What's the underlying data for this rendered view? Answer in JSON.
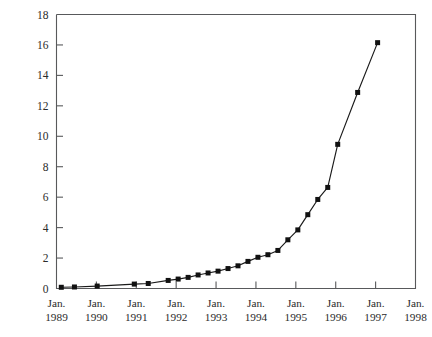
{
  "chart_data": {
    "type": "line",
    "title": "",
    "subtitle": "",
    "xlabel": "",
    "ylabel": "",
    "grid": false,
    "legend": "none",
    "axis_color": "#58595b",
    "series_color": "#111111",
    "marker": "square",
    "ylim": [
      0,
      18
    ],
    "yticks": [
      0,
      2,
      4,
      6,
      8,
      10,
      12,
      14,
      16,
      18
    ],
    "ytick_labels": [
      "0",
      "2",
      "4",
      "6",
      "8",
      "10",
      "12",
      "14",
      "16",
      "18"
    ],
    "xtick_labels": [
      "Jan.\n1989",
      "Jan.\n1990",
      "Jan.\n1991",
      "Jan.\n1992",
      "Jan.\n1993",
      "Jan.\n1994",
      "Jan.\n1995",
      "Jan.\n1996",
      "Jan.\n1997",
      "Jan.\n1998"
    ],
    "xtick_lines": [
      "Jan.",
      "Jan.",
      "Jan.",
      "Jan.",
      "Jan.",
      "Jan.",
      "Jan.",
      "Jan.",
      "Jan.",
      "Jan."
    ],
    "xtick_years": [
      "1989",
      "1990",
      "1991",
      "1992",
      "1993",
      "1994",
      "1995",
      "1996",
      "1997",
      "1998"
    ],
    "xlim_years": [
      1989.0,
      1998.0
    ],
    "x": [
      1989.12,
      1989.45,
      1990.02,
      1990.95,
      1991.3,
      1991.8,
      1992.05,
      1992.3,
      1992.55,
      1992.8,
      1993.05,
      1993.3,
      1993.55,
      1993.8,
      1994.05,
      1994.3,
      1994.55,
      1994.8,
      1995.05,
      1995.3,
      1995.55,
      1995.8,
      1996.05,
      1996.55,
      1997.05
    ],
    "values": [
      0.08,
      0.1,
      0.16,
      0.29,
      0.33,
      0.53,
      0.62,
      0.73,
      0.89,
      1.02,
      1.14,
      1.31,
      1.49,
      1.78,
      2.05,
      2.22,
      2.5,
      3.2,
      3.85,
      4.85,
      5.85,
      6.64,
      9.47,
      12.88,
      16.15
    ],
    "series": [
      {
        "name": "",
        "values": [
          0.08,
          0.1,
          0.16,
          0.29,
          0.33,
          0.53,
          0.62,
          0.73,
          0.89,
          1.02,
          1.14,
          1.31,
          1.49,
          1.78,
          2.05,
          2.22,
          2.5,
          3.2,
          3.85,
          4.85,
          5.85,
          6.64,
          9.47,
          12.88,
          16.15
        ]
      }
    ]
  }
}
